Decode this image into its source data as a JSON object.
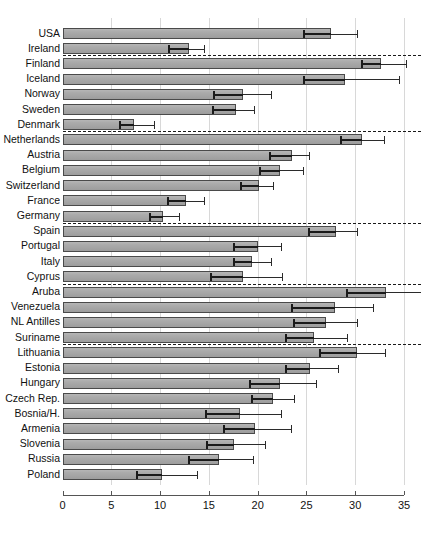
{
  "chart_data": {
    "type": "bar",
    "orientation": "horizontal",
    "title": "",
    "subtitle": "",
    "xlabel": "",
    "ylabel": "",
    "xlim": [
      0,
      35
    ],
    "ylim": null,
    "grid": true,
    "gridlines_x": [
      5,
      10,
      15,
      20,
      25,
      30,
      35
    ],
    "legend": null,
    "legend_position": "none",
    "xticks": [
      0,
      5,
      10,
      15,
      20,
      25,
      30,
      35
    ],
    "xtick_labels": [
      "0",
      "5",
      "10",
      "15",
      "20",
      "25",
      "30",
      "35"
    ],
    "categories": [
      "USA",
      "Ireland",
      "Finland",
      "Iceland",
      "Norway",
      "Sweden",
      "Denmark",
      "Netherlands",
      "Austria",
      "Belgium",
      "Switzerland",
      "France",
      "Germany",
      "Spain",
      "Portugal",
      "Italy",
      "Cyprus",
      "Aruba",
      "Venezuela",
      "NL Antilles",
      "Suriname",
      "Lithuania",
      "Estonia",
      "Hungary",
      "Czech Rep.",
      "Bosnia/H.",
      "Armenia",
      "Slovenia",
      "Russia",
      "Poland"
    ],
    "values": [
      27.5,
      13.0,
      32.6,
      29.0,
      18.5,
      17.8,
      7.3,
      30.7,
      23.5,
      22.3,
      20.1,
      12.7,
      10.3,
      28.0,
      20.0,
      19.4,
      18.5,
      33.2,
      27.9,
      27.0,
      25.8,
      30.2,
      25.4,
      22.3,
      21.6,
      18.2,
      19.7,
      17.6,
      16.0,
      10.2
    ],
    "error_low": [
      24.6,
      10.8,
      30.6,
      24.6,
      15.4,
      15.3,
      5.8,
      28.4,
      21.2,
      20.1,
      18.2,
      10.7,
      8.9,
      25.2,
      17.5,
      17.5,
      15.1,
      29.1,
      23.4,
      23.6,
      22.8,
      26.3,
      22.8,
      19.1,
      19.3,
      14.6,
      16.5,
      14.7,
      12.9,
      7.5
    ],
    "error_high": [
      30.2,
      14.5,
      35.2,
      34.5,
      21.4,
      19.6,
      9.4,
      33.0,
      25.3,
      24.6,
      21.6,
      14.5,
      11.9,
      30.2,
      22.4,
      21.4,
      22.5,
      37.0,
      31.8,
      30.2,
      29.2,
      33.1,
      28.2,
      26.0,
      23.7,
      22.4,
      23.4,
      20.8,
      19.5,
      13.8
    ],
    "group_separators_after": [
      "Ireland",
      "Denmark",
      "Germany",
      "Cyprus",
      "Suriname"
    ],
    "bar_fill_color": "#aaaaaa",
    "bar_edge_color": "#4a4a4a",
    "error_bar_color": "#1a1a1a",
    "separator_color": "#1a1a1a",
    "axis_color": "#555555",
    "gridline_color": "#d8d8d8",
    "background_color": "#ffffff"
  }
}
